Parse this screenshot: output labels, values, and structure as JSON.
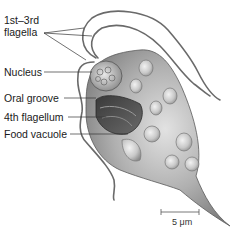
{
  "figure": {
    "labels": [
      {
        "id": "flagella-1-3",
        "line1": "1st–3rd",
        "line2": "flagella"
      },
      {
        "id": "nucleus",
        "text": "Nucleus"
      },
      {
        "id": "oral-groove",
        "text": "Oral groove"
      },
      {
        "id": "flagellum-4",
        "text": "4th flagellum"
      },
      {
        "id": "food-vacuole",
        "text": "Food vacuole"
      }
    ],
    "scale_bar": {
      "label": "5 μm"
    }
  },
  "colors": {
    "cell_body": "#9a9a9a",
    "cell_highlight": "#d8d8d8",
    "outline": "#555555",
    "flagella": "#6a6a6a",
    "leader_line": "#333333",
    "text": "#1a1a1a"
  }
}
